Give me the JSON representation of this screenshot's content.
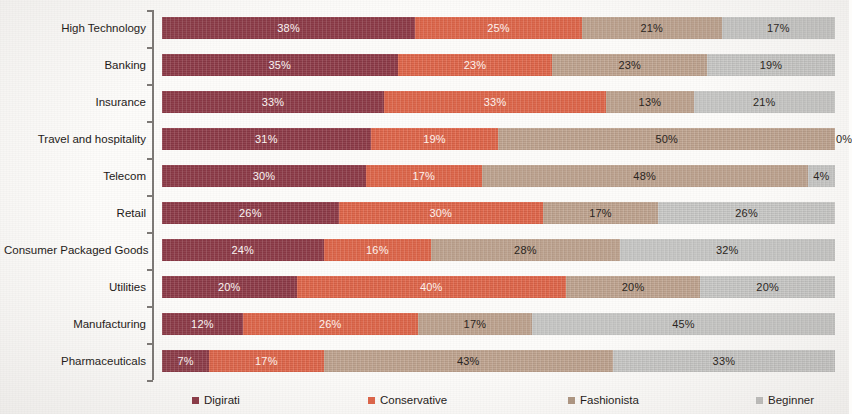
{
  "chart_data": {
    "type": "bar",
    "orientation": "horizontal",
    "stacked": true,
    "normalized": "100%",
    "title": "",
    "subtitle": "",
    "xlabel": "",
    "ylabel": "",
    "xlim": [
      0,
      100
    ],
    "grid": false,
    "legend_position": "bottom",
    "categories": [
      "High Technology",
      "Banking",
      "Insurance",
      "Travel and hospitality",
      "Telecom",
      "Retail",
      "Consumer Packaged Goods",
      "Utilities",
      "Manufacturing",
      "Pharmaceuticals"
    ],
    "series": [
      {
        "name": "Digirati",
        "color": "#8e3b48",
        "values": [
          38,
          35,
          33,
          31,
          30,
          26,
          24,
          20,
          12,
          7
        ],
        "labels": [
          "38%",
          "35%",
          "33%",
          "31%",
          "30%",
          "26%",
          "24%",
          "20%",
          "12%",
          "7%"
        ]
      },
      {
        "name": "Conservative",
        "color": "#e0664a",
        "values": [
          25,
          23,
          33,
          19,
          17,
          30,
          16,
          40,
          26,
          17
        ],
        "labels": [
          "25%",
          "23%",
          "33%",
          "19%",
          "17%",
          "30%",
          "16%",
          "40%",
          "26%",
          "17%"
        ]
      },
      {
        "name": "Fashionista",
        "color": "#bfa490",
        "values": [
          21,
          23,
          13,
          50,
          48,
          17,
          28,
          20,
          17,
          43
        ],
        "labels": [
          "21%",
          "23%",
          "13%",
          "50%",
          "48%",
          "17%",
          "28%",
          "20%",
          "17%",
          "43%"
        ]
      },
      {
        "name": "Beginner",
        "color": "#c9c9c7",
        "values": [
          17,
          19,
          21,
          0,
          4,
          26,
          32,
          20,
          45,
          33
        ],
        "labels": [
          "17%",
          "19%",
          "21%",
          "0%",
          "4%",
          "26%",
          "32%",
          "20%",
          "45%",
          "33%"
        ]
      }
    ]
  },
  "legend": {
    "items": [
      {
        "label": "Digirati"
      },
      {
        "label": "Conservative"
      },
      {
        "label": "Fashionista"
      },
      {
        "label": "Beginner"
      }
    ]
  }
}
